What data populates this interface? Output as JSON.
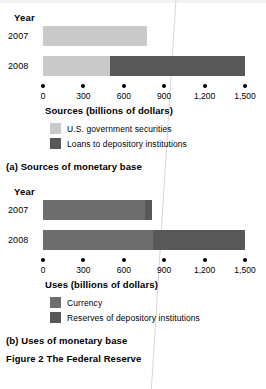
{
  "figure": {
    "title": "Figure 2 The Federal Reserve",
    "caption_a": "(a) Sources of monetary base",
    "caption_b": "(b) Uses of monetary base"
  },
  "colors": {
    "light_gray": "#c9c9c9",
    "medium_gray": "#6e6e6e",
    "dark_gray": "#585858",
    "text": "#000000",
    "background": "#ffffff"
  },
  "panel_a": {
    "year_header": "Year",
    "axis_title": "Sources (billions of dollars)",
    "row_labels": [
      "2007",
      "2008"
    ],
    "tick_labels": [
      "0",
      "300",
      "600",
      "900",
      "1,200",
      "1,500"
    ],
    "legend": [
      {
        "label": "U.S. government securities",
        "color": "#c9c9c9"
      },
      {
        "label": "Loans to depository institutions",
        "color": "#585858"
      }
    ]
  },
  "panel_b": {
    "year_header": "Year",
    "axis_title": "Uses (billions of dollars)",
    "row_labels": [
      "2007",
      "2008"
    ],
    "tick_labels": [
      "0",
      "300",
      "600",
      "900",
      "1,200",
      "1,500"
    ],
    "legend": [
      {
        "label": "Currency",
        "color": "#6e6e6e"
      },
      {
        "label": "Reserves of depository institutions",
        "color": "#585858"
      }
    ]
  },
  "chart_data": [
    {
      "type": "bar",
      "orientation": "horizontal",
      "stacked": true,
      "title": "(a) Sources of monetary base",
      "xlabel": "Sources (billions of dollars)",
      "ylabel": "Year",
      "xlim": [
        0,
        1500
      ],
      "xticks": [
        0,
        300,
        600,
        900,
        1200,
        1500
      ],
      "xticklabels": [
        "0",
        "300",
        "600",
        "900",
        "1,200",
        "1,500"
      ],
      "grid": false,
      "legend_position": "below",
      "categories": [
        "2007",
        "2008"
      ],
      "series": [
        {
          "name": "U.S. government securities",
          "color": "#c9c9c9",
          "values": [
            775,
            500
          ]
        },
        {
          "name": "Loans to depository institutions",
          "color": "#585858",
          "values": [
            0,
            1000
          ]
        }
      ],
      "totals": [
        775,
        1500
      ]
    },
    {
      "type": "bar",
      "orientation": "horizontal",
      "stacked": true,
      "title": "(b) Uses of monetary base",
      "xlabel": "Uses (billions of dollars)",
      "ylabel": "Year",
      "xlim": [
        0,
        1500
      ],
      "xticks": [
        0,
        300,
        600,
        900,
        1200,
        1500
      ],
      "xticklabels": [
        "0",
        "300",
        "600",
        "900",
        "1,200",
        "1,500"
      ],
      "grid": false,
      "legend_position": "below",
      "categories": [
        "2007",
        "2008"
      ],
      "series": [
        {
          "name": "Currency",
          "color": "#6e6e6e",
          "values": [
            760,
            820
          ]
        },
        {
          "name": "Reserves of depository institutions",
          "color": "#585858",
          "values": [
            50,
            680
          ]
        }
      ],
      "totals": [
        810,
        1500
      ]
    }
  ]
}
